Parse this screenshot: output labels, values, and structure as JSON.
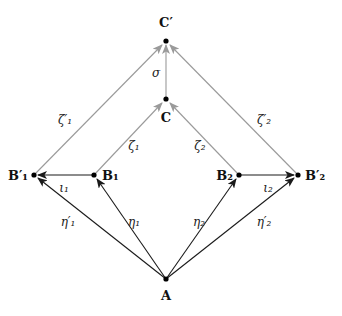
{
  "diagram": {
    "colors": {
      "black_edge": "#1a1a1a",
      "gray_edge": "#9a9a9a",
      "node": "#000000"
    },
    "nodes": {
      "Cp": {
        "label": "C′",
        "x": 166,
        "y": 41
      },
      "C": {
        "label": "C",
        "x": 166,
        "y": 99
      },
      "B1p": {
        "label": "B′₁",
        "x": 34,
        "y": 175
      },
      "B1": {
        "label": "B₁",
        "x": 94,
        "y": 175
      },
      "B2": {
        "label": "B₂",
        "x": 239,
        "y": 175
      },
      "B2p": {
        "label": "B′₂",
        "x": 298,
        "y": 175
      },
      "A": {
        "label": "A",
        "x": 166,
        "y": 279
      }
    },
    "edges": [
      {
        "from": "A",
        "to": "B1p",
        "label": "η′₁",
        "style": "black"
      },
      {
        "from": "A",
        "to": "B1",
        "label": "η₁",
        "style": "black"
      },
      {
        "from": "A",
        "to": "B2",
        "label": "η₂",
        "style": "black"
      },
      {
        "from": "A",
        "to": "B2p",
        "label": "η′₂",
        "style": "black"
      },
      {
        "from": "B1",
        "to": "B1p",
        "label": "ι₁",
        "style": "black"
      },
      {
        "from": "B2",
        "to": "B2p",
        "label": "ι₂",
        "style": "black"
      },
      {
        "from": "B1",
        "to": "C",
        "label": "ζ₁",
        "style": "gray"
      },
      {
        "from": "B2",
        "to": "C",
        "label": "ζ₂",
        "style": "gray"
      },
      {
        "from": "B1p",
        "to": "Cp",
        "label": "ζ′₁",
        "style": "gray"
      },
      {
        "from": "B2p",
        "to": "Cp",
        "label": "ζ′₂",
        "style": "gray"
      },
      {
        "from": "C",
        "to": "Cp",
        "label": "σ",
        "style": "gray"
      }
    ]
  }
}
